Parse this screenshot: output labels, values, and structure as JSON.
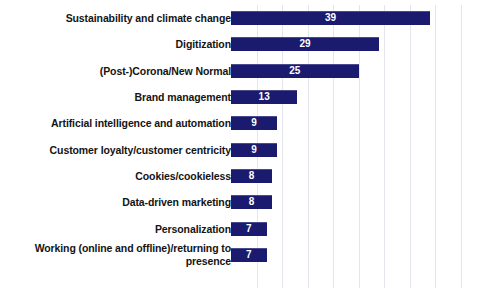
{
  "chart_data": {
    "type": "bar",
    "orientation": "horizontal",
    "title": "",
    "subtitle": "",
    "xlabel": "",
    "ylabel": "",
    "xlim": [
      0,
      45
    ],
    "grid": true,
    "grid_axis": "x",
    "gridline_interval": 5,
    "gridline_values": [
      5,
      10,
      15,
      20,
      25,
      30,
      35,
      40,
      45
    ],
    "legend": false,
    "legend_position": "none",
    "show_value_labels": true,
    "value_label_position": "center",
    "bar_color": "#1a1a6e",
    "value_label_color": "#ffffff",
    "gridline_color": "#e3e6ef",
    "category_label_color": "#141414",
    "background_color": "#ffffff",
    "categories": [
      "Sustainability and climate change",
      "Digitization",
      "(Post-)Corona/New Normal",
      "Brand management",
      "Artificial intelligence and automation",
      "Customer loyalty/customer centricity",
      "Cookies/cookieless",
      "Data-driven marketing",
      "Personalization",
      "Working (online and offline)/returning to presence"
    ],
    "values": [
      39,
      29,
      25,
      13,
      9,
      9,
      8,
      8,
      7,
      7
    ],
    "series": [
      {
        "name": "",
        "values": [
          39,
          29,
          25,
          13,
          9,
          9,
          8,
          8,
          7,
          7
        ]
      }
    ]
  },
  "bars": [
    {
      "label": "Sustainability and climate change",
      "value": "39"
    },
    {
      "label": "Digitization",
      "value": "29"
    },
    {
      "label": "(Post-)Corona/New Normal",
      "value": "25"
    },
    {
      "label": "Brand management",
      "value": "13"
    },
    {
      "label": "Artificial intelligence and automation",
      "value": "9"
    },
    {
      "label": "Customer loyalty/customer centricity",
      "value": "9"
    },
    {
      "label": "Cookies/cookieless",
      "value": "8"
    },
    {
      "label": "Data-driven marketing",
      "value": "8"
    },
    {
      "label": "Personalization",
      "value": "7"
    },
    {
      "label": "Working (online and offline)/returning to presence",
      "value": "7"
    }
  ]
}
